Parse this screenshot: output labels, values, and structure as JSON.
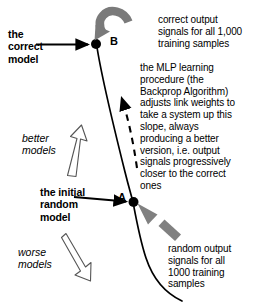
{
  "diagram": {
    "background_color": "#ffffff",
    "stroke_color": "#000000",
    "gray_arrow_color": "#808080",
    "points": {
      "b": {
        "label": "B",
        "name": "the correct model"
      },
      "a": {
        "label": "A",
        "name": "the initial random model"
      }
    },
    "labels": {
      "correct_model": "the\ncorrect\nmodel",
      "initial_random_model": "the initial\nrandom\nmodel",
      "better_models": "better\nmodels",
      "worse_models": "worse\nmodels",
      "correct_output": "correct output\nsignals for all 1,000\ntraining samples",
      "mlp_procedure": "the MLP learning\nprocedure (the\nBackprop Algorithm)\nadjusts link weights to\ntake a system up this\nslope, always\nproducing a better\nversion, i.e. output\nsignals progressively\ncloser to the correct\nones",
      "random_output": "random output\nsignals for all\n1000 training\nsamples"
    },
    "icons": {
      "curved_arrow_to_b": "curved-arrow-icon",
      "thick_arrow_to_a": "thick-arrow-icon",
      "dashed_up_arrow": "dashed-arrow-icon",
      "outline_up_arrow": "outline-up-arrow-icon",
      "outline_down_arrow": "outline-down-arrow-icon",
      "pointer_to_b": "pointer-arrow-icon",
      "pointer_to_a": "pointer-arrow-icon",
      "slope_curve": "curve-icon"
    }
  }
}
